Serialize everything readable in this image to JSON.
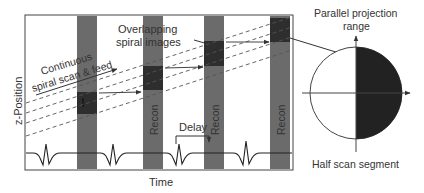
{
  "diagram": {
    "y_axis_label": "z-Position",
    "x_axis_label": "Time",
    "scan_label_line1": "Continuous",
    "scan_label_line2": "spiral scan & feed",
    "overlap_label_line1": "Overlapping",
    "overlap_label_line2": "spiral images",
    "recon_label": "Recon",
    "delay_label": "Delay",
    "projection_label_line1": "Parallel projection",
    "projection_label_line2": "range",
    "half_scan_label": "Half scan segment",
    "colors": {
      "bar": "#6b6b6b",
      "bar_dark": "#2e2e2e",
      "line": "#333333",
      "dashed": "#555555",
      "half_disk": "#222222"
    }
  }
}
